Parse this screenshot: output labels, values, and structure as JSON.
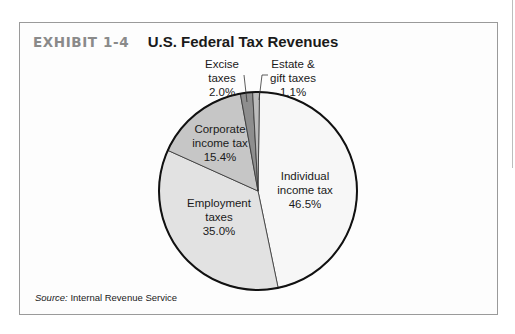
{
  "exhibit": {
    "label": "EXHIBIT 1-4",
    "title": "U.S. Federal Tax Revenues"
  },
  "source": {
    "prefix": "Source:",
    "text": " Internal Revenue Service"
  },
  "chart_data": {
    "type": "pie",
    "title": "U.S. Federal Tax Revenues",
    "slices": [
      {
        "label": "Individual income tax",
        "value": 46.5,
        "display": "46.5%",
        "color": "#f7f7f7"
      },
      {
        "label": "Employment taxes",
        "value": 35.0,
        "display": "35.0%",
        "color": "#e2e2e2"
      },
      {
        "label": "Corporate income tax",
        "value": 15.4,
        "display": "15.4%",
        "color": "#c6c6c6"
      },
      {
        "label": "Excise taxes",
        "value": 2.0,
        "display": "2.0%",
        "color": "#8e8e8e"
      },
      {
        "label": "Estate & gift taxes",
        "value": 1.1,
        "display": "1.1%",
        "color": "#bcbcbc"
      }
    ],
    "labels": {
      "individual": [
        "Individual",
        "income tax",
        "46.5%"
      ],
      "employment": [
        "Employment",
        "taxes",
        "35.0%"
      ],
      "corporate": [
        "Corporate",
        "income tax",
        "15.4%"
      ],
      "excise": [
        "Excise",
        "taxes",
        "2.0%"
      ],
      "estate": [
        "Estate &",
        "gift taxes",
        "1.1%"
      ]
    },
    "start_angle_deg": 0,
    "direction": "clockwise",
    "source": "Internal Revenue Service"
  }
}
